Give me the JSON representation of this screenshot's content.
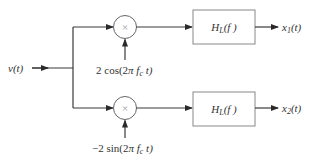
{
  "diagram": {
    "type": "quadrature demodulator block diagram",
    "input": {
      "label": "v(t)"
    },
    "branches": [
      {
        "id": "upper",
        "multiplier": {
          "symbol": "×"
        },
        "carrier": {
          "label_prefix": "2 cos(2",
          "label_pi": "π",
          "label_f": " f",
          "label_sub": "c",
          "label_suffix": " t)"
        },
        "filter": {
          "label_H": "H",
          "label_sub": "L",
          "label_arg": "(f )"
        },
        "output": {
          "label_x": "x",
          "label_sub": "1",
          "label_arg": "(t)"
        }
      },
      {
        "id": "lower",
        "multiplier": {
          "symbol": "×"
        },
        "carrier": {
          "label_prefix": "−2 sin(2",
          "label_pi": "π",
          "label_f": " f",
          "label_sub": "c",
          "label_suffix": " t)"
        },
        "filter": {
          "label_H": "H",
          "label_sub": "L",
          "label_arg": "(f )"
        },
        "output": {
          "label_x": "x",
          "label_sub": "2",
          "label_arg": "(t)"
        }
      }
    ]
  }
}
